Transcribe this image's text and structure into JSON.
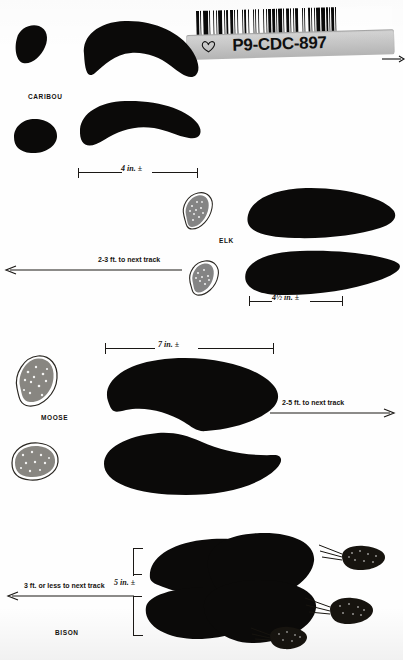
{
  "document": {
    "type": "field-guide-plate",
    "subject": "hoofed mammal tracks, droppings and stride",
    "background_color": "#fefefe",
    "ink_color": "#0b0a09"
  },
  "archive_label": {
    "code": "P9-CDC-897",
    "icon": "heart-outline-icon",
    "barcode_icon": "barcode-icon",
    "arrow_icon": "arrow-right-icon",
    "plate_color": "#c8c8c8"
  },
  "entries": [
    {
      "id": "caribou",
      "label": "CARIBOU",
      "track_width": "4 in. ±",
      "stride": null,
      "scat_count": 0
    },
    {
      "id": "elk",
      "label": "ELK",
      "track_width": "4½ in. ±",
      "stride": "2-3 ft. to next track",
      "stride_direction": "left",
      "scat_count": 2
    },
    {
      "id": "moose",
      "label": "MOOSE",
      "track_width": "7 in. ±",
      "stride": "2-5 ft. to next track",
      "stride_direction": "right",
      "scat_count": 2
    },
    {
      "id": "bison",
      "label": "BISON",
      "track_width": "5 in. ±",
      "stride": "3 ft. or less to next track",
      "stride_direction": "left",
      "scat_count": 3
    }
  ],
  "measures": {
    "caribou_width": "4 in. ±",
    "elk_width": "4½ in. ±",
    "moose_width": "7 in. ±",
    "bison_height": "5 in. ±"
  },
  "strides": {
    "elk": "2-3 ft. to next track",
    "moose": "2-5 ft. to next track",
    "bison": "3 ft. or less to next track"
  },
  "labels": {
    "caribou": "CARIBOU",
    "elk": "ELK",
    "moose": "MOOSE",
    "bison": "BISON"
  }
}
